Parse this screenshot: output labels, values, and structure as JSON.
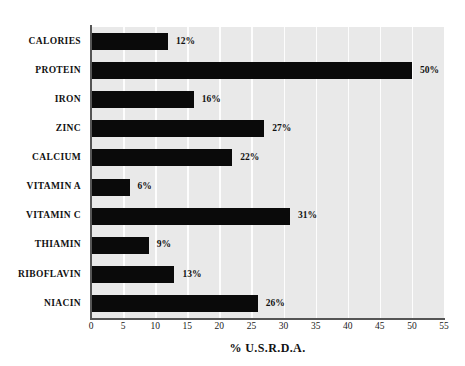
{
  "chart_data": {
    "type": "bar",
    "orientation": "horizontal",
    "title": "",
    "subtitle": "",
    "xlabel": "% U.S.R.D.A.",
    "ylabel": "",
    "xlim": [
      0,
      55
    ],
    "xticks": [
      0,
      5,
      10,
      15,
      20,
      25,
      30,
      35,
      40,
      45,
      50,
      55
    ],
    "xtick_labels": [
      "0",
      "5",
      "10",
      "15",
      "20",
      "25",
      "30",
      "35",
      "40",
      "45",
      "50",
      "55"
    ],
    "grid": true,
    "grid_axis": "x",
    "legend": false,
    "legend_position": "none",
    "categories": [
      "CALORIES",
      "PROTEIN",
      "IRON",
      "ZINC",
      "CALCIUM",
      "VITAMIN A",
      "VITAMIN C",
      "THIAMIN",
      "RIBOFLAVIN",
      "NIACIN"
    ],
    "values": [
      12,
      50,
      16,
      27,
      22,
      6,
      31,
      9,
      13,
      26
    ],
    "data_labels": [
      "12%",
      "50%",
      "16%",
      "27%",
      "22%",
      "6%",
      "31%",
      "9%",
      "13%",
      "26%"
    ],
    "bars": [
      {
        "category": "CALORIES",
        "value": 12,
        "label": "12%"
      },
      {
        "category": "PROTEIN",
        "value": 50,
        "label": "50%"
      },
      {
        "category": "IRON",
        "value": 16,
        "label": "16%"
      },
      {
        "category": "ZINC",
        "value": 27,
        "label": "27%"
      },
      {
        "category": "CALCIUM",
        "value": 22,
        "label": "22%"
      },
      {
        "category": "VITAMIN A",
        "value": 6,
        "label": "6%"
      },
      {
        "category": "VITAMIN C",
        "value": 31,
        "label": "31%"
      },
      {
        "category": "THIAMIN",
        "value": 9,
        "label": "9%"
      },
      {
        "category": "RIBOFLAVIN",
        "value": 13,
        "label": "13%"
      },
      {
        "category": "NIACIN",
        "value": 26,
        "label": "26%"
      }
    ],
    "colors": {
      "bar": "#0a0a0a",
      "plot_background": "#e9e9e9",
      "page_background": "#ffffff",
      "gridline": "#fdfdfd",
      "axis_line": "#555555",
      "text": "#111111"
    }
  }
}
